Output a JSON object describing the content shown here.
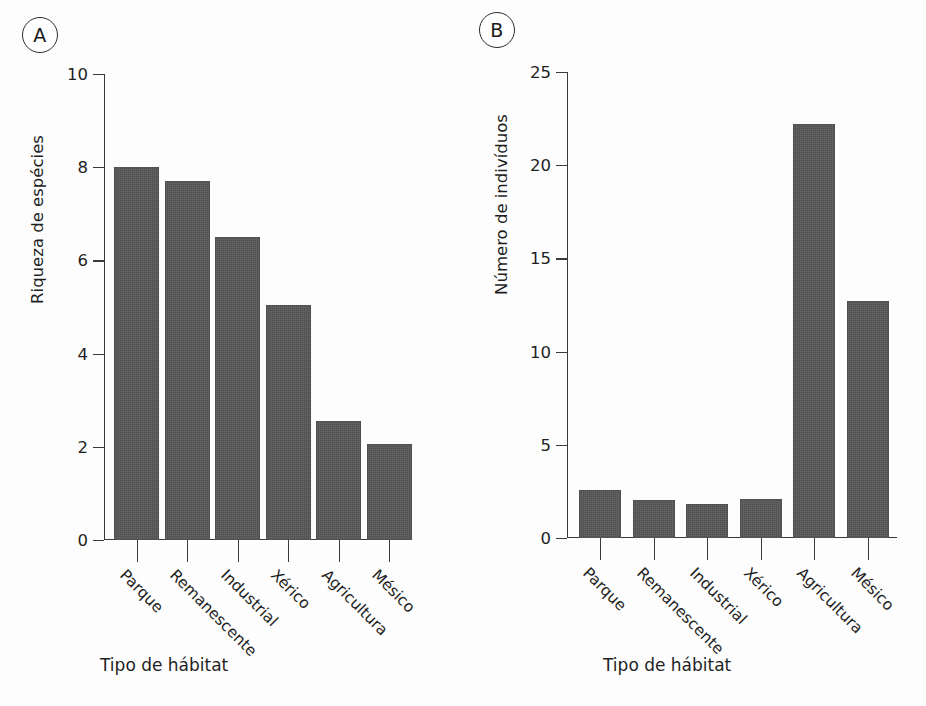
{
  "figure": {
    "background": "#fdfdfd",
    "bar_color": "#565656",
    "axis_color": "#3a3a3a",
    "text_color": "#1f1f1f"
  },
  "panels": [
    {
      "id": "A",
      "letter": "A"
    },
    {
      "id": "B",
      "letter": "B"
    }
  ],
  "chart_data": [
    {
      "type": "bar",
      "panel": "A",
      "title": "",
      "xlabel": "Tipo de hábitat",
      "ylabel": "Riqueza de espécies",
      "categories": [
        "Parque",
        "Remanescente",
        "Industrial",
        "Xérico",
        "Agricultura",
        "Mésico"
      ],
      "values": [
        8.0,
        7.7,
        6.5,
        5.05,
        2.55,
        2.05
      ],
      "ylim": [
        0,
        10
      ],
      "yticks": [
        0,
        2,
        4,
        6,
        8,
        10
      ],
      "ytick_labels": [
        "0",
        "2",
        "4",
        "6",
        "8",
        "10"
      ],
      "grid": false,
      "legend": "none"
    },
    {
      "type": "bar",
      "panel": "B",
      "title": "",
      "xlabel": "Tipo de hábitat",
      "ylabel": "Número de indivíduos",
      "categories": [
        "Parque",
        "Remanescente",
        "Industrial",
        "Xérico",
        "Agricultura",
        "Mésico"
      ],
      "values": [
        2.6,
        2.05,
        1.85,
        2.1,
        22.2,
        12.7
      ],
      "ylim": [
        0,
        25
      ],
      "yticks": [
        0,
        5,
        10,
        15,
        20,
        25
      ],
      "ytick_labels": [
        "0",
        "5",
        "10",
        "15",
        "20",
        "25"
      ],
      "grid": false,
      "legend": "none"
    }
  ]
}
